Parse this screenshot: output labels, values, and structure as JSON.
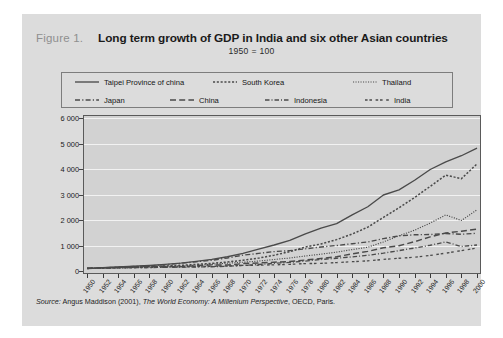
{
  "figure": {
    "label": "Figure 1.",
    "title": "Long term growth of GDP in India and six other Asian countries",
    "subtitle": "1950 = 100"
  },
  "source": {
    "lead": "Source:",
    "text_before": " Angus Maddison (2001), ",
    "italic": "The World Economy: A Millenium Perspective",
    "text_after": ", OECD, Paris."
  },
  "colors": {
    "panel_background": "#dcdcdc",
    "plot_background": "#d2d2d2",
    "gridline": "#f2f2f2",
    "axis": "#5a5a5a",
    "line": "#4a4a4a",
    "title_text": "#1a1a1a",
    "figure_label_text": "#8f8f8f"
  },
  "legend": {
    "rows": [
      [
        {
          "label": "Taipei Province of china",
          "style": "solid"
        },
        {
          "label": "South Korea",
          "style": "dotted-coarse"
        },
        {
          "label": "Thailand",
          "style": "dotted-fine"
        }
      ],
      [
        {
          "label": "Japan",
          "style": "dash-dot"
        },
        {
          "label": "China",
          "style": "long-dash"
        },
        {
          "label": "Indonesia",
          "style": "dash-dot-short"
        },
        {
          "label": "India",
          "style": "dash-pair"
        }
      ]
    ]
  },
  "chart_data": {
    "type": "line",
    "title": "Long term growth of GDP in India and six other Asian countries",
    "subtitle": "1950 = 100",
    "xlabel": "",
    "ylabel": "",
    "grid": true,
    "legend_position": "top",
    "xlim": [
      1950,
      2000
    ],
    "ylim": [
      0,
      6000
    ],
    "yticks": [
      0,
      1000,
      2000,
      3000,
      4000,
      5000,
      6000
    ],
    "ytick_labels": [
      "0",
      "1 000",
      "2 000",
      "3 000",
      "4 000",
      "5 000",
      "6 000"
    ],
    "x": [
      1950,
      1952,
      1954,
      1956,
      1958,
      1960,
      1962,
      1964,
      1966,
      1968,
      1970,
      1972,
      1974,
      1976,
      1978,
      1980,
      1982,
      1984,
      1986,
      1988,
      1990,
      1992,
      1994,
      1996,
      1998,
      2000
    ],
    "xtick_labels": [
      "1950",
      "1952",
      "1954",
      "1956",
      "1958",
      "1960",
      "1962",
      "1964",
      "1966",
      "1968",
      "1970",
      "1972",
      "1974",
      "1976",
      "1978",
      "1980",
      "1982",
      "1984",
      "1986",
      "1988",
      "1990",
      "1992",
      "1994",
      "1996",
      "1998",
      "2000"
    ],
    "series": [
      {
        "name": "Taipei Province of china",
        "style": "solid",
        "values": [
          100,
          130,
          158,
          186,
          220,
          262,
          310,
          380,
          455,
          560,
          690,
          860,
          1020,
          1200,
          1460,
          1680,
          1860,
          2200,
          2520,
          2980,
          3180,
          3560,
          3980,
          4280,
          4520,
          4820
        ]
      },
      {
        "name": "South Korea",
        "style": "dotted-coarse",
        "values": [
          100,
          118,
          140,
          158,
          180,
          198,
          222,
          258,
          300,
          352,
          420,
          505,
          620,
          760,
          940,
          1060,
          1230,
          1450,
          1720,
          2100,
          2480,
          2880,
          3320,
          3760,
          3620,
          4200
        ]
      },
      {
        "name": "Thailand",
        "style": "dotted-fine",
        "values": [
          100,
          112,
          124,
          138,
          152,
          172,
          198,
          228,
          268,
          305,
          345,
          390,
          450,
          510,
          590,
          660,
          740,
          840,
          930,
          1140,
          1380,
          1600,
          1880,
          2200,
          1980,
          2400
        ]
      },
      {
        "name": "China",
        "style": "long-dash",
        "values": [
          100,
          128,
          142,
          165,
          180,
          175,
          168,
          205,
          240,
          235,
          290,
          315,
          345,
          370,
          430,
          490,
          560,
          670,
          770,
          910,
          990,
          1150,
          1340,
          1490,
          1560,
          1640
        ]
      },
      {
        "name": "Japan",
        "style": "dash-dot",
        "values": [
          100,
          126,
          148,
          176,
          200,
          248,
          300,
          360,
          420,
          510,
          620,
          690,
          760,
          800,
          870,
          940,
          1000,
          1070,
          1140,
          1270,
          1380,
          1420,
          1430,
          1470,
          1440,
          1480
        ]
      },
      {
        "name": "Indonesia",
        "style": "dash-dot-short",
        "values": [
          100,
          112,
          124,
          132,
          136,
          148,
          150,
          158,
          168,
          188,
          218,
          255,
          300,
          340,
          390,
          450,
          500,
          555,
          615,
          700,
          800,
          900,
          1010,
          1140,
          960,
          1020
        ]
      },
      {
        "name": "India",
        "style": "dash-pair",
        "values": [
          100,
          108,
          120,
          128,
          138,
          152,
          160,
          176,
          180,
          200,
          222,
          228,
          242,
          262,
          290,
          300,
          330,
          365,
          398,
          455,
          500,
          540,
          610,
          700,
          800,
          900
        ]
      }
    ],
    "annotations": [
      {
        "text": "Thailand, South Korea and Indonesia dip at the 1997-98 Asian financial crisis"
      }
    ]
  }
}
